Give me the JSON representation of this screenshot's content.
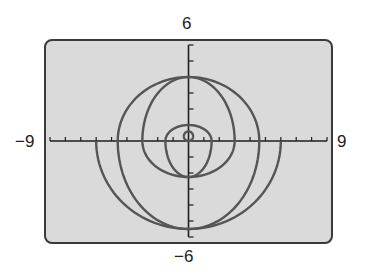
{
  "chart_data": {
    "type": "line",
    "title": "",
    "xlabel": "",
    "ylabel": "",
    "xlim": [
      -9,
      9
    ],
    "ylim": [
      -6,
      6
    ],
    "window_labels": {
      "xmin": "−9",
      "xmax": "9",
      "ymin": "−6",
      "ymax": "6"
    },
    "grid": false,
    "x_tick_step": 1,
    "y_tick_step": 1,
    "series": [
      {
        "name": "outer lower arc",
        "kind": "lower-half-ellipse",
        "center": [
          0,
          0
        ],
        "rx": 6,
        "ry": 5.5,
        "x_intercepts": [
          -6,
          6
        ],
        "y_min": -5.5
      },
      {
        "name": "large closed curve",
        "kind": "closed-curve",
        "top": [
          0,
          4
        ],
        "bottom": [
          0,
          -5.5
        ],
        "x_intercepts": [
          -4.6,
          4.6
        ]
      },
      {
        "name": "medium closed curve",
        "kind": "closed-curve",
        "top": [
          0,
          4
        ],
        "bottom": [
          0,
          -2.25
        ],
        "x_intercepts": [
          -3,
          3
        ]
      },
      {
        "name": "small closed curve",
        "kind": "closed-curve",
        "top": [
          0,
          1
        ],
        "bottom": [
          0,
          -2.25
        ],
        "x_intercepts": [
          -1.5,
          1.5
        ]
      },
      {
        "name": "inner loop",
        "kind": "closed-curve",
        "top": [
          0,
          0.6
        ],
        "bottom": [
          0,
          0
        ],
        "x_extent": [
          -0.3,
          0.3
        ]
      }
    ]
  },
  "colors": {
    "screen_bg": "#dadada",
    "frame": "#3a3a3a",
    "curve": "#555555",
    "axis": "#1e1e1e"
  }
}
